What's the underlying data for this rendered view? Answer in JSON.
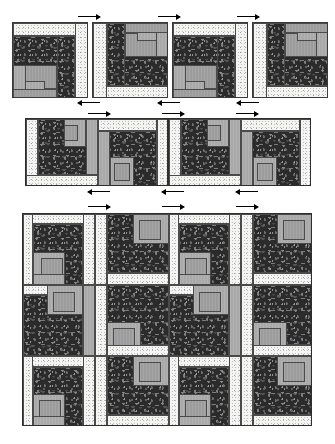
{
  "document": {
    "type": "quilt-block-assembly-diagram",
    "title": "Log Cabin Quilt Block Assembly Diagram",
    "background_color": "#ffffff",
    "width": 335,
    "height": 444
  },
  "fabrics": [
    {
      "id": "light",
      "name": "light-dotted-muslin",
      "color": "#f4f4f2",
      "role": "background"
    },
    {
      "id": "grey",
      "name": "solid-medium-grey",
      "color": "#a9a9a9",
      "role": "logs"
    },
    {
      "id": "dark",
      "name": "dark-paisley-print",
      "color": "#2b2b2b",
      "role": "contrast"
    }
  ],
  "sections": [
    {
      "id": "row-1",
      "name": "single-block-row",
      "block_count": 4,
      "blocks": [
        {
          "index": 1,
          "rotation": 0,
          "orientation": "light-top-right"
        },
        {
          "index": 2,
          "rotation": 180,
          "orientation": "light-bottom-left"
        },
        {
          "index": 3,
          "rotation": 0,
          "orientation": "light-top-right"
        },
        {
          "index": 4,
          "rotation": 180,
          "orientation": "light-bottom-left"
        }
      ],
      "arrows": [
        {
          "direction": "right",
          "position": "top"
        },
        {
          "direction": "right",
          "position": "top"
        },
        {
          "direction": "right",
          "position": "top"
        },
        {
          "direction": "left",
          "position": "bottom"
        },
        {
          "direction": "left",
          "position": "bottom"
        },
        {
          "direction": "left",
          "position": "bottom"
        }
      ]
    },
    {
      "id": "row-2",
      "name": "joined-pair-row",
      "block_count": 4,
      "pair_count": 2,
      "blocks": [
        {
          "index": 1,
          "rotation": 90,
          "orientation": "light-left"
        },
        {
          "index": 2,
          "rotation": 270,
          "orientation": "light-right"
        },
        {
          "index": 3,
          "rotation": 90,
          "orientation": "light-left"
        },
        {
          "index": 4,
          "rotation": 270,
          "orientation": "light-right"
        }
      ],
      "arrows": [
        {
          "direction": "right",
          "position": "top"
        },
        {
          "direction": "right",
          "position": "top"
        },
        {
          "direction": "right",
          "position": "top"
        },
        {
          "direction": "left",
          "position": "bottom"
        },
        {
          "direction": "left",
          "position": "bottom"
        },
        {
          "direction": "left",
          "position": "bottom"
        }
      ]
    },
    {
      "id": "row-3",
      "name": "full-quilt-top-grid",
      "columns": 4,
      "rows": 3,
      "block_count": 12,
      "arrows": [
        {
          "direction": "right",
          "position": "top"
        },
        {
          "direction": "right",
          "position": "top"
        },
        {
          "direction": "right",
          "position": "top"
        }
      ]
    }
  ],
  "legend": {
    "arrow_meaning": "pressing / seam direction"
  }
}
